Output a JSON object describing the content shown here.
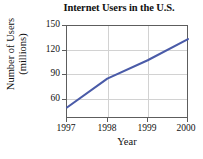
{
  "chart_data": {
    "type": "line",
    "title": "Internet Users in the U.S.",
    "xlabel": "Year",
    "ylabel_line1": "Number of Users",
    "ylabel_line2": "(millions)",
    "ylabel": "Number of Users (millions)",
    "x": [
      1997,
      1998,
      1999,
      2000
    ],
    "values": [
      57,
      90,
      111,
      135
    ],
    "categories": [
      "1997",
      "1998",
      "1999",
      "2000"
    ],
    "xtick_labels": [
      "1997",
      "1998",
      "1999",
      "2000"
    ],
    "ytick_labels": [
      "150",
      "120",
      "90",
      "60"
    ],
    "yticks": [
      150,
      120,
      90,
      60
    ],
    "xlim": [
      1997,
      2000
    ],
    "ylim": [
      45,
      150
    ],
    "grid": true,
    "grid_horizontal_at": [
      120,
      90,
      60
    ],
    "grid_vertical_at": [
      1998,
      1999
    ],
    "legend": false,
    "legend_position": "none",
    "series": [
      {
        "name": "Internet users",
        "color": "#4a5ba8",
        "values": [
          57,
          90,
          111,
          135
        ]
      }
    ]
  },
  "colors": {
    "line": "#4a5ba8",
    "frame": "#5d5d5d",
    "grid": "#d2d2d2",
    "text": "#111111",
    "background": "#ffffff"
  }
}
